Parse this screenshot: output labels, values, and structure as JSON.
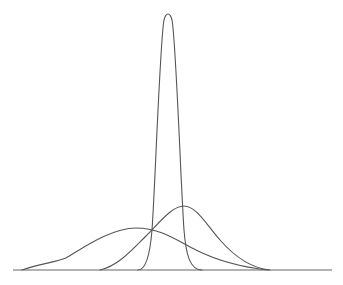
{
  "diagram": {
    "type": "distribution-curves",
    "stroke_color": "#555555",
    "axis_color": "#666666",
    "background": "#ffffff",
    "baseline": {
      "x1": 13,
      "x2": 332,
      "y": 270
    },
    "curves": [
      {
        "id": "narrow-tall",
        "label": "",
        "shape": "narrow, tall, symmetric peak",
        "peak": {
          "x": 168,
          "y": 15
        },
        "support": [
          138,
          202
        ],
        "path": "M138,270 C146,270 150,255 152,230 C155,190 160,40 164,20 C166,12 170,12 172,20 C176,40 181,190 184,230 C186,255 190,270 202,270"
      },
      {
        "id": "right-skewed",
        "label": "",
        "shape": "medium peak, slight right offset",
        "peak": {
          "x": 184,
          "y": 206
        },
        "support": [
          100,
          270
        ],
        "path": "M100,270 C118,266 132,250 146,236 C160,222 172,206 184,206 C196,206 206,224 220,240 C234,256 250,268 270,270"
      },
      {
        "id": "wide-left",
        "label": "",
        "shape": "wide, low, left-shifted peak",
        "peak": {
          "x": 136,
          "y": 228
        },
        "support": [
          22,
          268
        ],
        "path": "M22,270 C40,264 56,262 66,258 C80,250 110,228 136,228 C160,228 176,240 196,250 C216,260 240,267 268,270"
      }
    ],
    "intersections": [
      {
        "x": 154,
        "y": 230,
        "note": "all three curves meet near here"
      },
      {
        "x": 186,
        "y": 246,
        "note": "narrow curve crosses wide curve"
      }
    ]
  }
}
